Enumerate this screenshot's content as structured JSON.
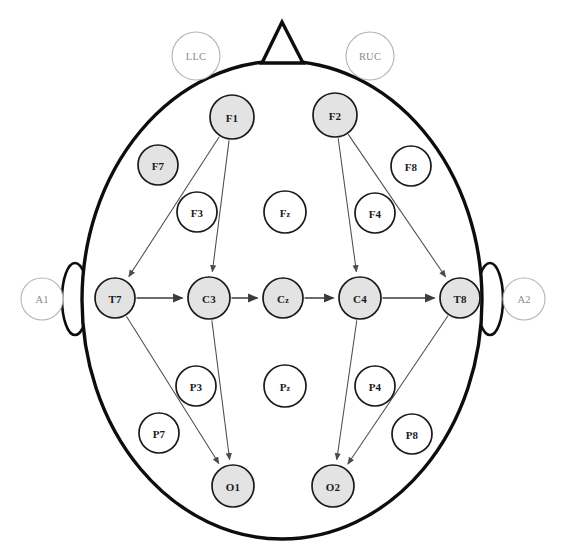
{
  "diagram": {
    "type": "node-link-head-map",
    "canvas": {
      "width": 561,
      "height": 558
    },
    "colors": {
      "shaded_node_fill": "#e3e3e3",
      "plain_node_fill": "#ffffff",
      "node_stroke": "#1a1a1a",
      "faint_stroke": "#b4b4b4",
      "faint_text": "#8a8a8a",
      "head_stroke": "#0d0d0d",
      "edge_stroke": "#4c4c4c",
      "background": "#ffffff"
    },
    "head": {
      "outline": {
        "cx": 282,
        "cy": 300,
        "rx": 200,
        "ry": 239
      },
      "nose": {
        "apex_x": 282,
        "apex_y": 22,
        "left_x": 262,
        "left_y": 63,
        "right_x": 303,
        "right_y": 63
      },
      "left_ear": {
        "cx": 75,
        "cy": 299,
        "rx": 13,
        "ry": 36
      },
      "right_ear": {
        "cx": 490,
        "cy": 299,
        "rx": 13,
        "ry": 36
      }
    },
    "electrodes": [
      {
        "id": "LLC",
        "label": "LLC",
        "cx": 196,
        "cy": 56,
        "r": 24,
        "style": "faint",
        "sub": false
      },
      {
        "id": "RUC",
        "label": "RUC",
        "cx": 370,
        "cy": 56,
        "r": 24,
        "style": "faint",
        "sub": false
      },
      {
        "id": "A1",
        "label": "A1",
        "cx": 42,
        "cy": 299,
        "r": 21,
        "style": "faint",
        "sub": false
      },
      {
        "id": "A2",
        "label": "A2",
        "cx": 524,
        "cy": 299,
        "r": 21,
        "style": "faint",
        "sub": false
      },
      {
        "id": "F1",
        "label": "F1",
        "cx": 232,
        "cy": 117,
        "r": 22,
        "style": "shaded",
        "sub": false
      },
      {
        "id": "F2",
        "label": "F2",
        "cx": 335,
        "cy": 115,
        "r": 22,
        "style": "shaded",
        "sub": false
      },
      {
        "id": "F7",
        "label": "F7",
        "cx": 158,
        "cy": 165,
        "r": 20,
        "style": "shaded",
        "sub": false
      },
      {
        "id": "F8",
        "label": "F8",
        "cx": 411,
        "cy": 166,
        "r": 20,
        "style": "plain",
        "sub": false
      },
      {
        "id": "F3",
        "label": "F3",
        "cx": 197,
        "cy": 212,
        "r": 20,
        "style": "plain",
        "sub": false
      },
      {
        "id": "Fz",
        "label": "Fz",
        "cx": 285,
        "cy": 212,
        "r": 21,
        "style": "plain",
        "sub": true
      },
      {
        "id": "F4",
        "label": "F4",
        "cx": 375,
        "cy": 213,
        "r": 20,
        "style": "plain",
        "sub": false
      },
      {
        "id": "T7",
        "label": "T7",
        "cx": 115,
        "cy": 298,
        "r": 20,
        "style": "shaded",
        "sub": false
      },
      {
        "id": "C3",
        "label": "C3",
        "cx": 209,
        "cy": 298,
        "r": 21,
        "style": "shaded",
        "sub": false
      },
      {
        "id": "Cz",
        "label": "Cz",
        "cx": 283,
        "cy": 298,
        "r": 20,
        "style": "shaded",
        "sub": true
      },
      {
        "id": "C4",
        "label": "C4",
        "cx": 360,
        "cy": 298,
        "r": 21,
        "style": "shaded",
        "sub": false
      },
      {
        "id": "T8",
        "label": "T8",
        "cx": 460,
        "cy": 298,
        "r": 20,
        "style": "shaded",
        "sub": false
      },
      {
        "id": "P3",
        "label": "P3",
        "cx": 196,
        "cy": 386,
        "r": 20,
        "style": "plain",
        "sub": false
      },
      {
        "id": "Pz",
        "label": "Pz",
        "cx": 285,
        "cy": 386,
        "r": 21,
        "style": "plain",
        "sub": true
      },
      {
        "id": "P4",
        "label": "P4",
        "cx": 375,
        "cy": 386,
        "r": 20,
        "style": "plain",
        "sub": false
      },
      {
        "id": "P7",
        "label": "P7",
        "cx": 159,
        "cy": 433,
        "r": 20,
        "style": "plain",
        "sub": false
      },
      {
        "id": "P8",
        "label": "P8",
        "cx": 412,
        "cy": 434,
        "r": 20,
        "style": "plain",
        "sub": false
      },
      {
        "id": "O1",
        "label": "O1",
        "cx": 233,
        "cy": 486,
        "r": 21,
        "style": "shaded",
        "sub": false
      },
      {
        "id": "O2",
        "label": "O2",
        "cx": 333,
        "cy": 486,
        "r": 21,
        "style": "shaded",
        "sub": false
      }
    ],
    "connections": [
      {
        "from": "F1",
        "to": "T7",
        "weight": "thin"
      },
      {
        "from": "F1",
        "to": "C3",
        "weight": "thin"
      },
      {
        "from": "F2",
        "to": "C4",
        "weight": "thin"
      },
      {
        "from": "F2",
        "to": "T8",
        "weight": "thin"
      },
      {
        "from": "T7",
        "to": "C3",
        "weight": "strong"
      },
      {
        "from": "C3",
        "to": "Cz",
        "weight": "strong"
      },
      {
        "from": "Cz",
        "to": "C4",
        "weight": "strong"
      },
      {
        "from": "C4",
        "to": "T8",
        "weight": "strong"
      },
      {
        "from": "T7",
        "to": "O1",
        "weight": "thin"
      },
      {
        "from": "C3",
        "to": "O1",
        "weight": "thin"
      },
      {
        "from": "C4",
        "to": "O2",
        "weight": "thin"
      },
      {
        "from": "T8",
        "to": "O2",
        "weight": "thin"
      }
    ]
  }
}
